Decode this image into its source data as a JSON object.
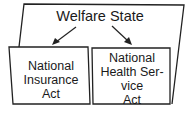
{
  "diagram": {
    "title": "Welfare State",
    "children": [
      {
        "label_lines": [
          "National",
          "Insurance",
          "Act"
        ]
      },
      {
        "label_lines": [
          "National",
          "Health Ser-",
          "vice",
          "Act"
        ]
      }
    ]
  },
  "colors": {
    "line": "#222222",
    "background": "#ffffff"
  }
}
